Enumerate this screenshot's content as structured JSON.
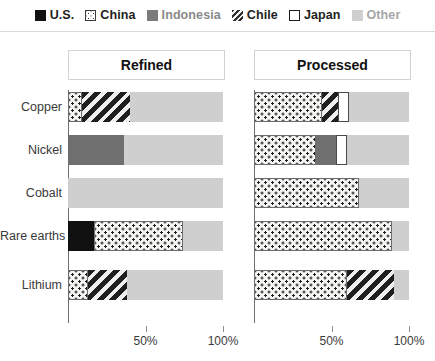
{
  "legend": {
    "items": [
      {
        "label": "U.S.",
        "key": "us",
        "color": "#111111",
        "pattern": "solid-black",
        "style": "dark"
      },
      {
        "label": "China",
        "key": "china",
        "color": "#f4f4f2",
        "pattern": "dotted",
        "style": "dark"
      },
      {
        "label": "Indonesia",
        "key": "indonesia",
        "color": "#7b7b7b",
        "pattern": "solid-gray",
        "style": "mid"
      },
      {
        "label": "Chile",
        "key": "chile",
        "color": "#2a2a2a",
        "pattern": "diagonal-hatch",
        "style": "dark"
      },
      {
        "label": "Japan",
        "key": "japan",
        "color": "#ffffff",
        "pattern": "outline-white",
        "style": "dark"
      },
      {
        "label": "Other",
        "key": "other",
        "color": "#cfcfcf",
        "pattern": "solid-light",
        "style": "muted"
      }
    ]
  },
  "panels": {
    "refined_title": "Refined",
    "processed_title": "Processed"
  },
  "axis": {
    "ticks": [
      "50%",
      "100%"
    ],
    "tick_values": [
      50,
      100
    ],
    "max": 100
  },
  "categories": [
    "Copper",
    "Nickel",
    "Cobalt",
    "Rare earths",
    "Lithium"
  ],
  "chart_data": {
    "type": "bar",
    "orientation": "horizontal",
    "stacked": true,
    "title": "",
    "xlabel": "",
    "ylabel": "",
    "xlim": [
      0,
      100
    ],
    "grid": false,
    "legend_position": "top",
    "categories": [
      "Copper",
      "Nickel",
      "Cobalt",
      "Rare earths",
      "Lithium"
    ],
    "panels": [
      {
        "name": "Refined",
        "series": [
          {
            "name": "U.S.",
            "values": [
              0,
              0,
              0,
              17,
              0
            ]
          },
          {
            "name": "China",
            "values": [
              9,
              0,
              0,
              57,
              13
            ]
          },
          {
            "name": "Indonesia",
            "values": [
              0,
              36,
              0,
              0,
              0
            ]
          },
          {
            "name": "Chile",
            "values": [
              31,
              0,
              0,
              0,
              25
            ]
          },
          {
            "name": "Japan",
            "values": [
              0,
              0,
              0,
              0,
              0
            ]
          },
          {
            "name": "Other",
            "values": [
              60,
              64,
              100,
              26,
              62
            ]
          }
        ]
      },
      {
        "name": "Processed",
        "series": [
          {
            "name": "U.S.",
            "values": [
              0,
              0,
              0,
              0,
              0
            ]
          },
          {
            "name": "China",
            "values": [
              44,
              40,
              68,
              89,
              60
            ]
          },
          {
            "name": "Indonesia",
            "values": [
              0,
              13,
              0,
              0,
              0
            ]
          },
          {
            "name": "Chile",
            "values": [
              10,
              0,
              0,
              0,
              30
            ]
          },
          {
            "name": "Japan",
            "values": [
              7,
              7,
              0,
              0,
              0
            ]
          },
          {
            "name": "Other",
            "values": [
              39,
              40,
              32,
              11,
              10
            ]
          }
        ]
      }
    ]
  }
}
